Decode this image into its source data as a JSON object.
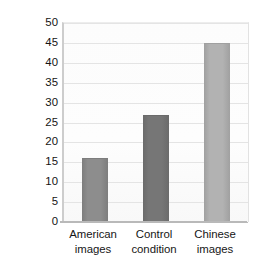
{
  "chart_data": {
    "type": "bar",
    "title": "",
    "subtitle": "",
    "xlabel": "",
    "ylabel": "Percentage of situational attributions",
    "categories": [
      "American images",
      "Control condition",
      "Chinese images"
    ],
    "category_lines": [
      [
        "American",
        "images"
      ],
      [
        "Control",
        "condition"
      ],
      [
        "Chinese",
        "images"
      ]
    ],
    "values": [
      16,
      27,
      45
    ],
    "ylim": [
      0,
      50
    ],
    "ytick_step": 5,
    "ytick_labels": [
      "0",
      "5",
      "10",
      "15",
      "20",
      "25",
      "30",
      "35",
      "40",
      "45",
      "50"
    ],
    "ytick_values": [
      0,
      5,
      10,
      15,
      20,
      25,
      30,
      35,
      40,
      45,
      50
    ],
    "grid": true,
    "grid_axis": "y",
    "legend": false,
    "legend_position": "none",
    "bar_colors": [
      "#8d8d8d",
      "#767676",
      "#b2b2b2"
    ],
    "bar_edge_colors": [
      "#7d7d7d",
      "#6b6b6b",
      "#a0a0a0"
    ],
    "bar_width_px": 26,
    "plot_background": "#fcfcfc",
    "gridline_color": "#e4e4e4",
    "axis_color": "#b9b9b9",
    "text_color": "#161616"
  }
}
